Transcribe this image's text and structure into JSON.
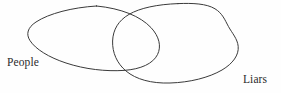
{
  "diagram": {
    "type": "venn-euler-diagram",
    "title": "",
    "background_color": "#fefefe",
    "stroke_color": "#3a3a3a",
    "stroke_width": 1,
    "text_color": "#2b2b2b",
    "sets": [
      {
        "id": "people",
        "label": "People",
        "shape": "ellipse",
        "position": "left",
        "label_position": "outside-lower-left"
      },
      {
        "id": "liars",
        "label": "Liars",
        "shape": "irregular-blob",
        "position": "right",
        "label_position": "outside-lower-right"
      }
    ],
    "relation": "partial-overlap",
    "intersection": {
      "present": true,
      "label": ""
    }
  },
  "labels": {
    "people": "People",
    "liars": "Liars"
  }
}
